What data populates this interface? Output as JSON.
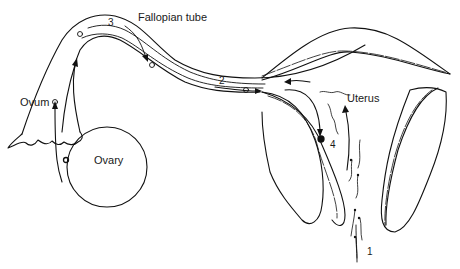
{
  "diagram": {
    "labels": {
      "fallopian_tube": "Fallopian tube",
      "ovum": "Ovum",
      "ovary": "Ovary",
      "uterus": "Uterus"
    },
    "step_numbers": {
      "one": "1",
      "two": "2",
      "three": "3",
      "four": "4"
    },
    "colors": {
      "line": "#111111",
      "background": "#ffffff"
    }
  }
}
